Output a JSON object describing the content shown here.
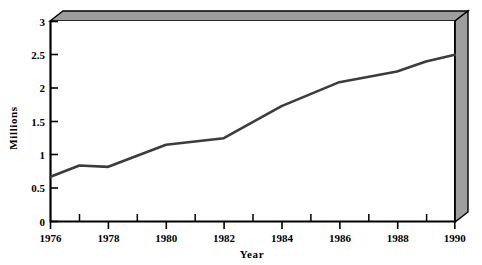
{
  "chart_data": {
    "type": "line",
    "title": "",
    "subtitle": "",
    "xlabel": "Year",
    "ylabel": "Millions",
    "xlim": [
      1976,
      1990
    ],
    "ylim": [
      0,
      3
    ],
    "grid": false,
    "legend_position": "none",
    "style": "3d-walls-shaded",
    "x_tick_labels": [
      "1976",
      "1978",
      "1980",
      "1982",
      "1984",
      "1986",
      "1988",
      "1990"
    ],
    "x_tick_values": [
      1976,
      1978,
      1980,
      1982,
      1984,
      1986,
      1988,
      1990
    ],
    "x_minor_tick_values": [
      1977,
      1979,
      1981,
      1983,
      1985,
      1987,
      1989
    ],
    "y_tick_labels": [
      "0",
      "0.5",
      "1",
      "1.5",
      "2",
      "2.5",
      "3"
    ],
    "y_tick_values": [
      0,
      0.5,
      1,
      1.5,
      2,
      2.5,
      3
    ],
    "x": [
      1976,
      1977,
      1978,
      1980,
      1982,
      1984,
      1986,
      1988,
      1989,
      1990
    ],
    "values": [
      0.67,
      0.84,
      0.82,
      1.15,
      1.25,
      1.73,
      2.09,
      2.25,
      2.4,
      2.5
    ],
    "series": [
      {
        "name": "Millions",
        "x": [
          1976,
          1977,
          1978,
          1980,
          1982,
          1984,
          1986,
          1988,
          1989,
          1990
        ],
        "values": [
          0.67,
          0.84,
          0.82,
          1.15,
          1.25,
          1.73,
          2.09,
          2.25,
          2.4,
          2.5
        ]
      }
    ],
    "annotations": []
  },
  "colors": {
    "background": "#ffffff",
    "plot_background": "#ffffff",
    "line": "#3c3c3c",
    "axis": "#000000",
    "wall_shade": "#9e9e9e",
    "wall_shade_light": "#b5b5b5",
    "text": "#000000"
  },
  "axes": {
    "y_title": "Millions",
    "x_title": "Year"
  }
}
